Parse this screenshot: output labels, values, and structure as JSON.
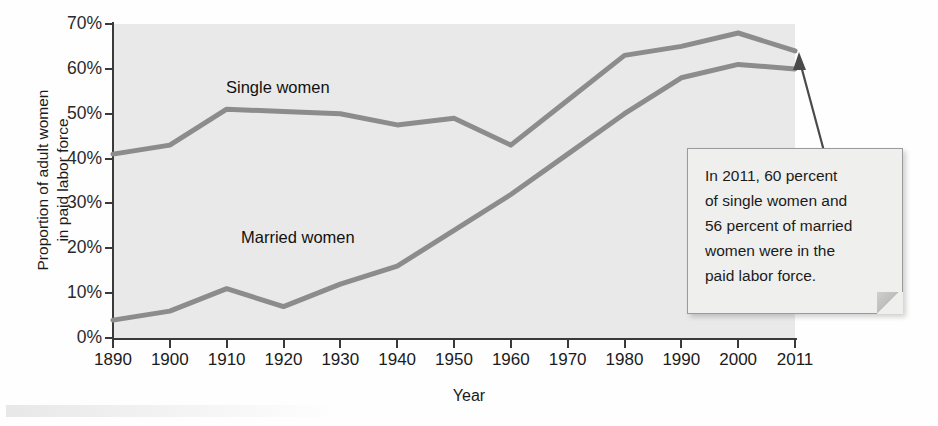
{
  "chart_data": {
    "type": "line",
    "title": "",
    "xlabel": "Year",
    "ylabel": "Proportion of adult women in paid labor force",
    "ylabel_line1": "Proportion of adult women",
    "ylabel_line2": "in paid labor force",
    "x": [
      1890,
      1900,
      1910,
      1920,
      1930,
      1940,
      1950,
      1960,
      1970,
      1980,
      1990,
      2000,
      2011
    ],
    "xtick_labels": [
      "1890",
      "1900",
      "1910",
      "1920",
      "1930",
      "1940",
      "1950",
      "1960",
      "1970",
      "1980",
      "1990",
      "2000",
      "2011"
    ],
    "ytick_labels": [
      "0%",
      "10%",
      "20%",
      "30%",
      "40%",
      "50%",
      "60%",
      "70%"
    ],
    "ytick_values": [
      0,
      10,
      20,
      30,
      40,
      50,
      60,
      70
    ],
    "ylim": [
      0,
      70
    ],
    "xlim": [
      1890,
      2011
    ],
    "grid": false,
    "legend_position": "inline-labels",
    "series": [
      {
        "name": "Single women",
        "color": "#8c8c8c",
        "values": [
          41,
          43,
          51,
          50.5,
          50,
          47.5,
          49,
          43,
          53,
          63,
          65,
          68,
          64
        ]
      },
      {
        "name": "Married women",
        "color": "#8c8c8c",
        "values": [
          4,
          6,
          11,
          7,
          12,
          16,
          24,
          32,
          41,
          50,
          58,
          61,
          60
        ]
      }
    ],
    "annotations": [
      {
        "name": "callout-2011",
        "lines": [
          "In 2011, 60 percent",
          "of single women and",
          "56 percent of married",
          "women were in the",
          "paid labor force."
        ],
        "points_to": {
          "x": 2011,
          "y": 62
        }
      }
    ]
  },
  "colors": {
    "plot_background": "#e9e9e9",
    "line": "#8c8c8c",
    "axis": "#3a3a3a",
    "text": "#1b1b1b",
    "callout_background": "#efefee",
    "callout_border": "#9a9a9a"
  }
}
